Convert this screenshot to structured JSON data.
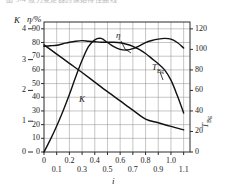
{
  "page": {
    "cut_caption": "图 5-4  液力变矩器的原始特性曲线"
  },
  "axes": {
    "left_primary_title": "K",
    "left_secondary_title": "η/%",
    "right_title": "TBg/N·m",
    "right_title_main": "T",
    "right_title_sub": "Bg",
    "right_title_tail": "/N·m",
    "x_title": "i",
    "k_ticks": [
      "4",
      "3",
      "2",
      "1",
      "0"
    ],
    "k_values": [
      4,
      3,
      2,
      1,
      0
    ],
    "eta_ticks": [
      "90",
      "80",
      "70",
      "60",
      "50",
      "40",
      "30",
      "20",
      "10",
      "0"
    ],
    "eta_values": [
      90,
      80,
      70,
      60,
      50,
      40,
      30,
      20,
      10,
      0
    ],
    "t_ticks": [
      "120",
      "100",
      "80",
      "60",
      "40",
      "20",
      "0"
    ],
    "t_values": [
      120,
      100,
      80,
      60,
      40,
      20,
      0
    ],
    "x_ticks_upper": [
      "0",
      "0.2",
      "0.4",
      "0.6",
      "0.8",
      "1.0"
    ],
    "x_ticks_lower": [
      "0.1",
      "0.3",
      "0.5",
      "0.7",
      "0.9",
      "1.1"
    ],
    "x_upper_values": [
      0,
      0.2,
      0.4,
      0.6,
      0.8,
      1.0
    ],
    "x_lower_values": [
      0.1,
      0.3,
      0.5,
      0.7,
      0.9,
      1.1
    ]
  },
  "curve_labels": {
    "eta": "η",
    "k": "K",
    "tbg_main": "T",
    "tbg_sub": "Bg"
  },
  "colors": {
    "curve": "#111111",
    "grid": "#8c8c8c",
    "frame": "#2b2b2b",
    "background": "#ffffff",
    "caption": "#b9b9b9"
  },
  "chart_data": {
    "type": "line",
    "title": "",
    "xlabel": "i",
    "ylabel": "η/%",
    "y2label": "T_Bg/N·m",
    "xlim": [
      0,
      1.15
    ],
    "ylim": [
      0,
      95
    ],
    "y2lim": [
      0,
      126.7
    ],
    "klim": [
      0,
      4.222
    ],
    "grid": true,
    "legend": "inline-annotations",
    "series": [
      {
        "name": "η",
        "axis": "left-eta",
        "unit": "%",
        "x": [
          0.0,
          0.05,
          0.1,
          0.15,
          0.2,
          0.25,
          0.3,
          0.35,
          0.4,
          0.45,
          0.5,
          0.55,
          0.6,
          0.65,
          0.7,
          0.75,
          0.8,
          0.85,
          0.9,
          0.95,
          1.0,
          1.05,
          1.1
        ],
        "y": [
          0,
          9,
          19,
          30,
          42,
          55,
          67,
          77,
          82,
          83,
          80,
          77,
          75,
          74.5,
          75.5,
          77.5,
          80,
          81.5,
          82.5,
          83,
          82.5,
          80,
          76
        ]
      },
      {
        "name": "T_Bg",
        "axis": "right",
        "unit": "N·m",
        "x": [
          0.0,
          0.05,
          0.1,
          0.15,
          0.2,
          0.25,
          0.3,
          0.35,
          0.4,
          0.45,
          0.5,
          0.55,
          0.6,
          0.65,
          0.7,
          0.75,
          0.8,
          0.85,
          0.9,
          0.95,
          1.0,
          1.05,
          1.1
        ],
        "y": [
          103,
          103.5,
          104,
          105.5,
          107,
          108,
          108.5,
          108,
          107.5,
          107,
          107,
          107,
          106.5,
          105,
          103,
          100,
          96,
          91,
          86,
          80,
          70,
          55,
          38
        ]
      },
      {
        "name": "K",
        "axis": "left-K",
        "unit": "",
        "x": [
          0.0,
          0.1,
          0.2,
          0.3,
          0.4,
          0.5,
          0.6,
          0.7,
          0.8,
          0.9,
          1.0,
          1.1
        ],
        "y": [
          3.48,
          3.18,
          2.88,
          2.58,
          2.27,
          1.96,
          1.66,
          1.36,
          1.07,
          0.95,
          0.83,
          0.72
        ]
      }
    ],
    "annotations": [
      {
        "text": "η",
        "x": 0.5,
        "y": 88
      },
      {
        "text": "T_Bg",
        "x": 0.8,
        "y": 62
      },
      {
        "text": "K",
        "x": 0.33,
        "y": 38
      }
    ]
  }
}
